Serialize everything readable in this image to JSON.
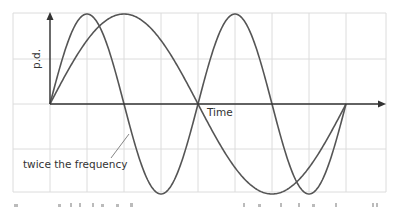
{
  "diagram": {
    "y_axis_label": "p.d.",
    "x_axis_label": "Time",
    "annotation": "twice the frequency",
    "colors": {
      "grid": "#dcdcdc",
      "axes": "#333333",
      "curves": "#555555",
      "text": "#333333"
    }
  },
  "chart_data": {
    "type": "line",
    "title": "",
    "xlabel": "Time",
    "ylabel": "p.d.",
    "grid": true,
    "series": [
      {
        "name": "original wave",
        "description": "one full sine cycle",
        "cycles": 1,
        "amplitude": 1
      },
      {
        "name": "twice the frequency",
        "description": "two full sine cycles over same time",
        "cycles": 2,
        "amplitude": 1
      }
    ],
    "x_range": [
      0,
      1
    ],
    "y_range": [
      -1,
      1
    ]
  }
}
